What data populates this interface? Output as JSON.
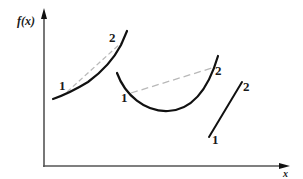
{
  "diagram": {
    "type": "function-convexity-illustration",
    "colors": {
      "curve": "#111111",
      "axis": "#555555",
      "chord": "#b8b8b8",
      "text": "#1a1a1a"
    },
    "axes": {
      "y_label": "f(x)",
      "x_label": "x"
    },
    "curves": [
      {
        "id": "convex-increasing",
        "description": "Convex increasing curve with chord from point 1 to point 2 lying above curve",
        "point1_label": "1",
        "point2_label": "2"
      },
      {
        "id": "convex-u-shaped",
        "description": "U-shaped convex curve with dashed chord from point 1 to point 2",
        "point1_label": "1",
        "point2_label": "2"
      },
      {
        "id": "linear",
        "description": "Straight line segment from point 1 to point 2",
        "point1_label": "1",
        "point2_label": "2"
      }
    ]
  }
}
